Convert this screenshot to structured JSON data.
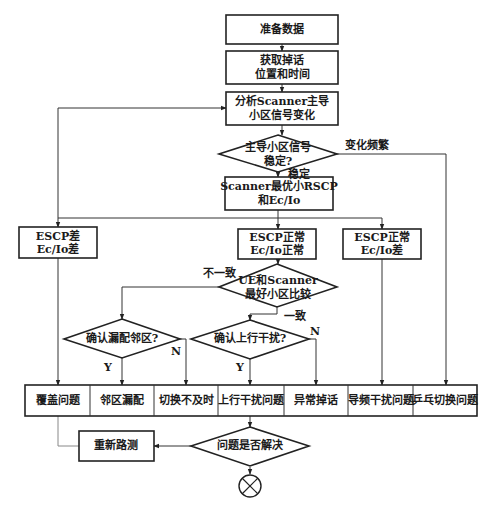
{
  "nodes": {
    "prepare_data": "准备数据",
    "get_drop": [
      "获取掉话",
      "位置和时间"
    ],
    "analyze_scanner": [
      "分析Scanner主导",
      "小区信号变化"
    ],
    "decision_stable": [
      "主导小区信号",
      "稳定?"
    ],
    "scanner_best": [
      "Scanner最优小RSCP",
      "和Ec/Io"
    ],
    "escp_bad": [
      "ESCP差",
      "Ec/Io差"
    ],
    "escp_ok_ecio_ok": [
      "ESCP正常",
      "Ec/Io正常"
    ],
    "escp_ok_ecio_bad": [
      "ESCP正常",
      "Ec/Io差"
    ],
    "decision_ue_scanner": [
      "UE和Scanner",
      "最好小区比较"
    ],
    "decision_missing_neighbor": "确认漏配邻区?",
    "decision_uplink": "确认上行干扰?",
    "rerun_drive_test": "重新路测",
    "decision_resolved": "问题是否解决"
  },
  "results_row": [
    "覆盖问题",
    "邻区漏配",
    "切换不及时",
    "上行干扰问题",
    "异常掉话",
    "导频干扰问题",
    "乒乓切换问题"
  ],
  "edge_labels": {
    "frequent_change": "变化频繁",
    "stable": "稳定",
    "inconsistent": "不一致",
    "consistent": "一致",
    "yes1": "Y",
    "no1": "N",
    "yes2": "Y",
    "no2": "N"
  },
  "end_symbol": "end-circle-x"
}
